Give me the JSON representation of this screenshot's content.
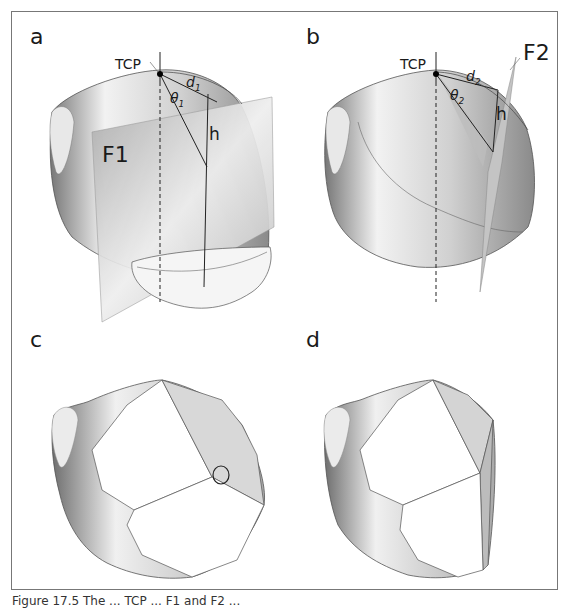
{
  "figure": {
    "caption_partial": "Figure 17.5 The ... TCP ... F1 and F2 ...",
    "panels": [
      {
        "label": "a",
        "annotations": {
          "tcp": "TCP",
          "distance": "d",
          "distance_sub": "1",
          "angle": "θ",
          "angle_sub": "1",
          "height": "h",
          "plane": "F1"
        }
      },
      {
        "label": "b",
        "annotations": {
          "tcp": "TCP",
          "distance": "d",
          "distance_sub": "2",
          "angle": "θ",
          "angle_sub": "2",
          "height": "h",
          "plane": "F2"
        }
      },
      {
        "label": "c",
        "annotations": {
          "marker": "circle-highlight"
        }
      },
      {
        "label": "d",
        "annotations": {}
      }
    ]
  },
  "colors": {
    "frame": "#777777",
    "surface_dark": "#6e6e6e",
    "surface_mid": "#b4b4b4",
    "surface_light": "#f4f4f4",
    "plane": "#c8c8c8",
    "line": "#333333"
  }
}
